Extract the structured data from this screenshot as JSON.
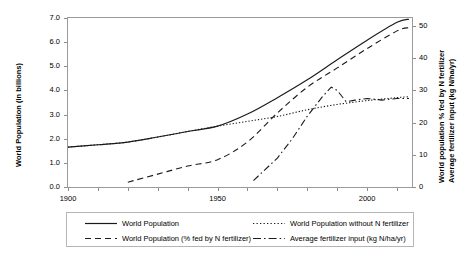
{
  "chart_data": {
    "type": "line",
    "title": "",
    "xlabel": "",
    "ylabel": "World Population (in billions)",
    "ylabel_right_1": "World population % fed by N fertilizer",
    "ylabel_right_2": "Average fertilizer input (kg N/ha/yr)",
    "grid": false,
    "legend_position": "bottom",
    "xlim": [
      1900,
      2015
    ],
    "xticks_major": [
      1900,
      1950,
      2000
    ],
    "xtick_labels": [
      "1900",
      "1950",
      "2000"
    ],
    "xtick_minor_step": 10,
    "ylim_left": [
      0.0,
      7.0
    ],
    "yticks_left": [
      0.0,
      1.0,
      2.0,
      3.0,
      4.0,
      5.0,
      6.0,
      7.0
    ],
    "ytick_labels_left": [
      "0.0",
      "1.0",
      "2.0",
      "3.0",
      "4.0",
      "5.0",
      "6.0",
      "7.0"
    ],
    "ylim_right": [
      0,
      52.5
    ],
    "yticks_right": [
      0,
      10,
      20,
      30,
      40,
      50
    ],
    "ytick_labels_right": [
      "0",
      "10",
      "20",
      "30",
      "40",
      "50"
    ],
    "series": [
      {
        "name": "World Population",
        "style": "solid",
        "axis": "left",
        "color": "#1a1a1a",
        "x": [
          1900,
          1910,
          1920,
          1930,
          1940,
          1950,
          1960,
          1970,
          1980,
          1990,
          2000,
          2010,
          2014
        ],
        "values": [
          1.65,
          1.75,
          1.86,
          2.07,
          2.3,
          2.52,
          3.02,
          3.7,
          4.44,
          5.27,
          6.08,
          6.82,
          6.95
        ]
      },
      {
        "name": "World Population without N fertilizer",
        "style": "dotted",
        "axis": "left",
        "color": "#1a1a1a",
        "x": [
          1900,
          1910,
          1920,
          1930,
          1940,
          1950,
          1960,
          1970,
          1980,
          1990,
          2000,
          2010,
          2014
        ],
        "values": [
          1.65,
          1.75,
          1.86,
          2.07,
          2.3,
          2.52,
          2.72,
          2.92,
          3.2,
          3.42,
          3.58,
          3.7,
          3.74
        ]
      },
      {
        "name": "World Population (% fed by N fertilizer)",
        "style": "dashed",
        "axis": "right",
        "color": "#1a1a1a",
        "x": [
          1920,
          1930,
          1940,
          1950,
          1960,
          1970,
          1980,
          1990,
          2000,
          2010,
          2014
        ],
        "values": [
          1.5,
          4.0,
          6.5,
          8.5,
          14.0,
          23.0,
          31.0,
          37.0,
          43.0,
          48.5,
          49.5
        ]
      },
      {
        "name": "Average fertilizer input (kg N/ha/yr)",
        "style": "dashdot",
        "axis": "right",
        "color": "#1a1a1a",
        "x": [
          1962,
          1970,
          1975,
          1980,
          1985,
          1988,
          1990,
          1993,
          1996,
          2000,
          2005,
          2010,
          2014
        ],
        "values": [
          2.0,
          9.0,
          15.0,
          22.0,
          28.0,
          31.0,
          30.0,
          26.5,
          27.0,
          27.5,
          27.0,
          27.5,
          27.5
        ]
      }
    ],
    "legend": [
      {
        "label": "World Population",
        "style": "solid"
      },
      {
        "label": "World Population without N fertilizer",
        "style": "dotted"
      },
      {
        "label": "World Population (% fed by N fertilizer)",
        "style": "dashed"
      },
      {
        "label": "Average fertilizer input (kg N/ha/yr)",
        "style": "dashdot"
      }
    ]
  }
}
